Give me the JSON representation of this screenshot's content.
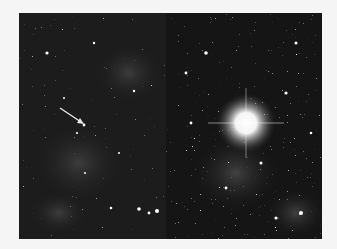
{
  "figure": {
    "background_color": "#f5f5f5",
    "panels": [
      {
        "id": "before",
        "annotation": "arrow pointing to faint star",
        "arrow_color": "#e8e8e8",
        "sky_color": "#1c1c1c"
      },
      {
        "id": "after",
        "annotation": "bright star with diffraction glow",
        "glow_color": "#ffffff",
        "sky_color": "#151515"
      }
    ]
  }
}
